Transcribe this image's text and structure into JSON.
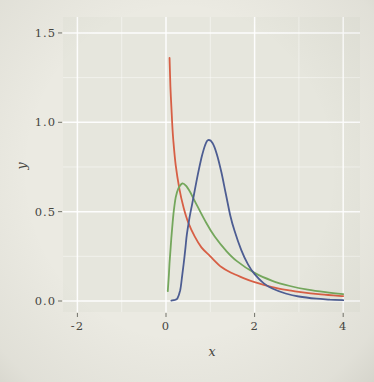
{
  "figure": {
    "kind": "photographed-statistics-plot",
    "outer_background": "#ebeae2",
    "panel_background": "#e6e6dd",
    "gridline_color": "#ffffff"
  },
  "chart_data": {
    "type": "line",
    "title": "",
    "xlabel": "x",
    "ylabel": "y",
    "xlim": [
      -2.33,
      4.42
    ],
    "ylim": [
      -0.067,
      1.6
    ],
    "grid": true,
    "legend": false,
    "x_ticks": [
      -2,
      0,
      2,
      4
    ],
    "x_tick_labels": [
      "-2",
      "0",
      "2",
      "4"
    ],
    "y_ticks": [
      0.0,
      0.5,
      1.0,
      1.5
    ],
    "y_tick_labels": [
      "0.0",
      "0.5",
      "1.0",
      "1.5"
    ],
    "x_minor_ticks": [
      -1,
      1,
      3
    ],
    "y_minor_ticks": [
      0.25,
      0.75,
      1.25
    ],
    "series": [
      {
        "name": "red-curve",
        "color": "#d75f45",
        "points": [
          [
            0.08,
            1.36
          ],
          [
            0.1,
            1.2
          ],
          [
            0.13,
            1.04
          ],
          [
            0.165,
            0.9
          ],
          [
            0.22,
            0.76
          ],
          [
            0.3,
            0.63
          ],
          [
            0.4,
            0.52
          ],
          [
            0.5,
            0.44
          ],
          [
            0.65,
            0.36
          ],
          [
            0.8,
            0.3
          ],
          [
            1.0,
            0.25
          ],
          [
            1.25,
            0.19
          ],
          [
            1.5,
            0.155
          ],
          [
            1.75,
            0.128
          ],
          [
            2.0,
            0.105
          ],
          [
            2.25,
            0.088
          ],
          [
            2.5,
            0.072
          ],
          [
            2.75,
            0.061
          ],
          [
            3.0,
            0.051
          ],
          [
            3.5,
            0.037
          ],
          [
            4.0,
            0.027
          ]
        ]
      },
      {
        "name": "green-curve",
        "color": "#74a75c",
        "points": [
          [
            0.04,
            0.055
          ],
          [
            0.06,
            0.13
          ],
          [
            0.08,
            0.21
          ],
          [
            0.12,
            0.35
          ],
          [
            0.17,
            0.49
          ],
          [
            0.22,
            0.58
          ],
          [
            0.28,
            0.63
          ],
          [
            0.37,
            0.658
          ],
          [
            0.45,
            0.645
          ],
          [
            0.55,
            0.607
          ],
          [
            0.7,
            0.535
          ],
          [
            0.9,
            0.441
          ],
          [
            1.1,
            0.361
          ],
          [
            1.35,
            0.283
          ],
          [
            1.6,
            0.223
          ],
          [
            2.0,
            0.157
          ],
          [
            2.4,
            0.113
          ],
          [
            2.8,
            0.084
          ],
          [
            3.2,
            0.063
          ],
          [
            3.6,
            0.049
          ],
          [
            4.0,
            0.038
          ]
        ]
      },
      {
        "name": "blue-curve",
        "color": "#4d5d92",
        "points": [
          [
            0.12,
            0.002
          ],
          [
            0.2,
            0.006
          ],
          [
            0.26,
            0.015
          ],
          [
            0.32,
            0.06
          ],
          [
            0.36,
            0.13
          ],
          [
            0.4,
            0.21
          ],
          [
            0.44,
            0.3
          ],
          [
            0.47,
            0.37
          ],
          [
            0.52,
            0.45
          ],
          [
            0.58,
            0.53
          ],
          [
            0.65,
            0.62
          ],
          [
            0.72,
            0.71
          ],
          [
            0.8,
            0.8
          ],
          [
            0.88,
            0.87
          ],
          [
            0.95,
            0.9
          ],
          [
            1.05,
            0.885
          ],
          [
            1.15,
            0.82
          ],
          [
            1.25,
            0.72
          ],
          [
            1.35,
            0.6
          ],
          [
            1.45,
            0.48
          ],
          [
            1.55,
            0.39
          ],
          [
            1.7,
            0.285
          ],
          [
            1.85,
            0.205
          ],
          [
            2.0,
            0.15
          ],
          [
            2.2,
            0.1
          ],
          [
            2.4,
            0.07
          ],
          [
            2.7,
            0.042
          ],
          [
            3.0,
            0.025
          ],
          [
            3.4,
            0.013
          ],
          [
            3.7,
            0.008
          ],
          [
            4.0,
            0.005
          ]
        ]
      }
    ]
  }
}
